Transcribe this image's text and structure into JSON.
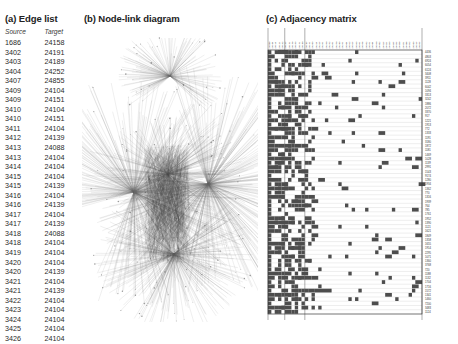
{
  "figure": {
    "panels": {
      "a": {
        "label": "(a)",
        "title": "(a) Edge list"
      },
      "b": {
        "label": "(b)",
        "title": "(b) Node-link diagram"
      },
      "c": {
        "label": "(c)",
        "title": "(c) Adjacency matrix"
      }
    }
  },
  "edge_list": {
    "columns": [
      "Source",
      "Target"
    ],
    "rows": [
      [
        "1686",
        "24158"
      ],
      [
        "3402",
        "24191"
      ],
      [
        "3403",
        "24189"
      ],
      [
        "3404",
        "24252"
      ],
      [
        "3407",
        "24855"
      ],
      [
        "3409",
        "24104"
      ],
      [
        "3409",
        "24151"
      ],
      [
        "3410",
        "24104"
      ],
      [
        "3410",
        "24151"
      ],
      [
        "3411",
        "24104"
      ],
      [
        "3412",
        "24139"
      ],
      [
        "3413",
        "24088"
      ],
      [
        "3413",
        "24104"
      ],
      [
        "3414",
        "24104"
      ],
      [
        "3415",
        "24104"
      ],
      [
        "3415",
        "24139"
      ],
      [
        "3416",
        "24104"
      ],
      [
        "3416",
        "24139"
      ],
      [
        "3417",
        "24104"
      ],
      [
        "3417",
        "24139"
      ],
      [
        "3418",
        "24088"
      ],
      [
        "3418",
        "24104"
      ],
      [
        "3419",
        "24104"
      ],
      [
        "3420",
        "24104"
      ],
      [
        "3420",
        "24139"
      ],
      [
        "3421",
        "24104"
      ],
      [
        "3421",
        "24139"
      ],
      [
        "3422",
        "24104"
      ],
      [
        "3423",
        "24104"
      ],
      [
        "3424",
        "24104"
      ],
      [
        "3425",
        "24104"
      ],
      [
        "3426",
        "24104"
      ]
    ]
  },
  "node_link": {
    "description": "dense hairball graph with two large radial hubs and a central dense core",
    "edge_color": "#6b6b6b",
    "node_color": "#3c3c3c"
  },
  "adjacency_matrix": {
    "cell_color": "#4d4d4d",
    "grid_color": "#b9b9b9",
    "border_color": "#2a2a2a",
    "n_columns": 46,
    "n_rows": 62,
    "column_labels": [
      "24088",
      "24104",
      "24113",
      "24121",
      "24132",
      "24139",
      "24151",
      "24158",
      "24163",
      "24171",
      "24180",
      "24189",
      "24191",
      "24203",
      "24214",
      "24225",
      "24231",
      "24240",
      "24252",
      "24261",
      "24270",
      "24283",
      "24291",
      "24304",
      "24312",
      "24325",
      "24333",
      "24341",
      "24356",
      "24362",
      "24371",
      "24384",
      "24390",
      "24402",
      "24415",
      "24421",
      "24433",
      "24447",
      "24455",
      "24468",
      "24471",
      "24486",
      "24492",
      "24503",
      "24515",
      "24855"
    ],
    "row_labels": [
      "4436",
      "4803",
      "6924",
      "6054",
      "6124",
      "3408",
      "3911",
      "1128",
      "6042",
      "1094",
      "3313",
      "3242",
      "1886",
      "2072",
      "3370",
      "917",
      "1221",
      "1913",
      "772",
      "1333",
      "1191",
      "3180",
      "1872",
      "1181",
      "1469",
      "1028",
      "1139",
      "2991",
      "1543",
      "9174",
      "1280",
      "1934",
      "1362",
      "770",
      "1316",
      "1939",
      "764",
      "785",
      "1761",
      "1952",
      "1390",
      "1121",
      "1621",
      "1849",
      "1358",
      "1655",
      "1914",
      "2295",
      "1071",
      "1360",
      "3768",
      "720",
      "1188",
      "1132",
      "1704",
      "1716",
      "1572",
      "1341",
      "1460",
      "7200",
      "3483",
      "1124"
    ]
  }
}
